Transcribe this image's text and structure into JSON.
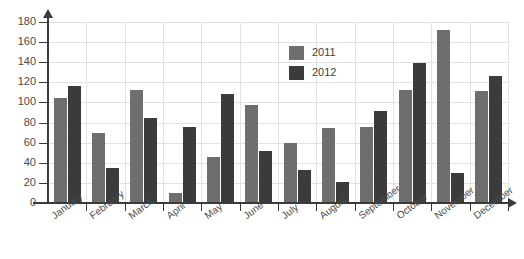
{
  "chart_data": {
    "type": "bar",
    "title": "",
    "xlabel": "",
    "ylabel": "",
    "ylim": [
      0,
      180
    ],
    "ytick_step": 20,
    "yticks": [
      0,
      20,
      40,
      60,
      80,
      100,
      120,
      140,
      160,
      180
    ],
    "grid": true,
    "legend_position": "inside-top-center",
    "categories": [
      "January",
      "February",
      "March",
      "April",
      "May",
      "June",
      "July",
      "August",
      "September",
      "October",
      "November",
      "December"
    ],
    "series": [
      {
        "name": "2011",
        "color": "#6e6e6e",
        "values": [
          104,
          70,
          112,
          10,
          46,
          97,
          60,
          75,
          76,
          112,
          172,
          111
        ]
      },
      {
        "name": "2012",
        "color": "#3b3b3b",
        "values": [
          116,
          35,
          85,
          76,
          108,
          52,
          33,
          21,
          92,
          139,
          30,
          126
        ]
      }
    ]
  },
  "legend": {
    "items": [
      {
        "label": "2011",
        "color": "#6e6e6e"
      },
      {
        "label": "2012",
        "color": "#3b3b3b"
      }
    ]
  },
  "colors": {
    "axis": "#3a3a3a",
    "grid": "#e2e2e2",
    "background": "#ffffff",
    "series_2011": "#6e6e6e",
    "series_2012": "#3b3b3b"
  }
}
